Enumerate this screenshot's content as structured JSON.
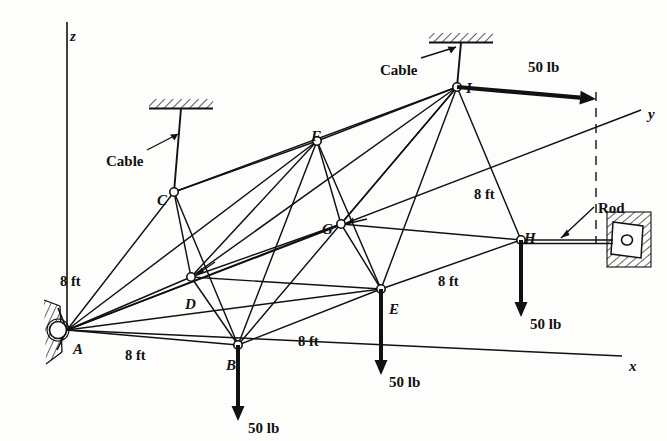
{
  "figure": {
    "kind": "space-truss-free-body-diagram",
    "background_color": "#fdfdfb",
    "ink_color": "#111111"
  },
  "axes": [
    {
      "name": "z",
      "label": "z",
      "label_x": 70,
      "label_y": 28
    },
    {
      "name": "y",
      "label": "y",
      "label_x": 648,
      "label_y": 106
    },
    {
      "name": "x",
      "label": "x",
      "label_x": 629,
      "label_y": 358
    }
  ],
  "nodes": [
    {
      "id": "A",
      "label": "A",
      "x": 67,
      "y": 330,
      "label_x": 73,
      "label_y": 341,
      "joint": "pin-support"
    },
    {
      "id": "B",
      "label": "B",
      "x": 238,
      "y": 345,
      "label_x": 226,
      "label_y": 357,
      "joint": "pin"
    },
    {
      "id": "C",
      "label": "C",
      "x": 174,
      "y": 192,
      "label_x": 157,
      "label_y": 192,
      "joint": "pin"
    },
    {
      "id": "D",
      "label": "D",
      "x": 191,
      "y": 277,
      "label_x": 185,
      "label_y": 296,
      "joint": "pin"
    },
    {
      "id": "E",
      "label": "E",
      "x": 381,
      "y": 289,
      "label_x": 389,
      "label_y": 301,
      "joint": "pin"
    },
    {
      "id": "F",
      "label": "F",
      "x": 317,
      "y": 141,
      "label_x": 311,
      "label_y": 128,
      "joint": "pin"
    },
    {
      "id": "G",
      "label": "G",
      "x": 341,
      "y": 224,
      "label_x": 322,
      "label_y": 221,
      "joint": "pin"
    },
    {
      "id": "H",
      "label": "H",
      "x": 521,
      "y": 240,
      "label_x": 524,
      "label_y": 230,
      "joint": "pin"
    },
    {
      "id": "I",
      "label": "I",
      "x": 457,
      "y": 87,
      "label_x": 466,
      "label_y": 80,
      "joint": "pin"
    }
  ],
  "members": [
    {
      "from": "A",
      "to": "B"
    },
    {
      "from": "A",
      "to": "C"
    },
    {
      "from": "A",
      "to": "D"
    },
    {
      "from": "A",
      "to": "E"
    },
    {
      "from": "A",
      "to": "F"
    },
    {
      "from": "A",
      "to": "G"
    },
    {
      "from": "B",
      "to": "C"
    },
    {
      "from": "B",
      "to": "D"
    },
    {
      "from": "B",
      "to": "E"
    },
    {
      "from": "B",
      "to": "F"
    },
    {
      "from": "B",
      "to": "I"
    },
    {
      "from": "C",
      "to": "D"
    },
    {
      "from": "C",
      "to": "F"
    },
    {
      "from": "C",
      "to": "I"
    },
    {
      "from": "D",
      "to": "E"
    },
    {
      "from": "D",
      "to": "F"
    },
    {
      "from": "D",
      "to": "G"
    },
    {
      "from": "D",
      "to": "I"
    },
    {
      "from": "E",
      "to": "F"
    },
    {
      "from": "E",
      "to": "G"
    },
    {
      "from": "E",
      "to": "H"
    },
    {
      "from": "E",
      "to": "I"
    },
    {
      "from": "F",
      "to": "G"
    },
    {
      "from": "F",
      "to": "I"
    },
    {
      "from": "G",
      "to": "H"
    },
    {
      "from": "G",
      "to": "I"
    },
    {
      "from": "H",
      "to": "I"
    }
  ],
  "supports": [
    {
      "id": "pin-A",
      "type": "pin-hatched-wall",
      "x": 67,
      "y": 330
    },
    {
      "id": "cable-C",
      "type": "cable-ceiling",
      "x": 174,
      "y": 192,
      "top_y": 104
    },
    {
      "id": "cable-I",
      "type": "cable-ceiling",
      "x": 457,
      "y": 87,
      "top_y": 38
    },
    {
      "id": "rod-H",
      "type": "rod-wall",
      "x": 521,
      "y": 240,
      "wall_x": 626
    }
  ],
  "loads": [
    {
      "at": "B",
      "label": "50 lb",
      "direction": "down",
      "tip_y": 421,
      "label_x": 248,
      "label_y": 420
    },
    {
      "at": "E",
      "label": "50 lb",
      "direction": "down",
      "tip_y": 375,
      "label_x": 389,
      "label_y": 374
    },
    {
      "at": "H",
      "label": "50 lb",
      "direction": "down",
      "tip_y": 317,
      "label_x": 530,
      "label_y": 316
    },
    {
      "at": "I",
      "label": "50 lb",
      "direction": "right-along-y",
      "tip_x": 596,
      "tip_y": 99,
      "label_x": 528,
      "label_y": 59
    }
  ],
  "dimensions": [
    {
      "label": "8 ft",
      "x": 60,
      "y": 273,
      "for": "A-C"
    },
    {
      "label": "8 ft",
      "x": 125,
      "y": 347,
      "for": "A-B"
    },
    {
      "label": "8 ft",
      "x": 298,
      "y": 333,
      "for": "B-E"
    },
    {
      "label": "8 ft",
      "x": 438,
      "y": 273,
      "for": "E-H"
    },
    {
      "label": "8 ft",
      "x": 474,
      "y": 186,
      "for": "I-H"
    }
  ],
  "annotations": [
    {
      "label": "Cable",
      "x": 106,
      "y": 153,
      "points_to": "cable-C"
    },
    {
      "label": "Cable",
      "x": 380,
      "y": 62,
      "points_to": "cable-I"
    },
    {
      "label": "Rod",
      "x": 598,
      "y": 200,
      "points_to": "rod-H"
    }
  ]
}
